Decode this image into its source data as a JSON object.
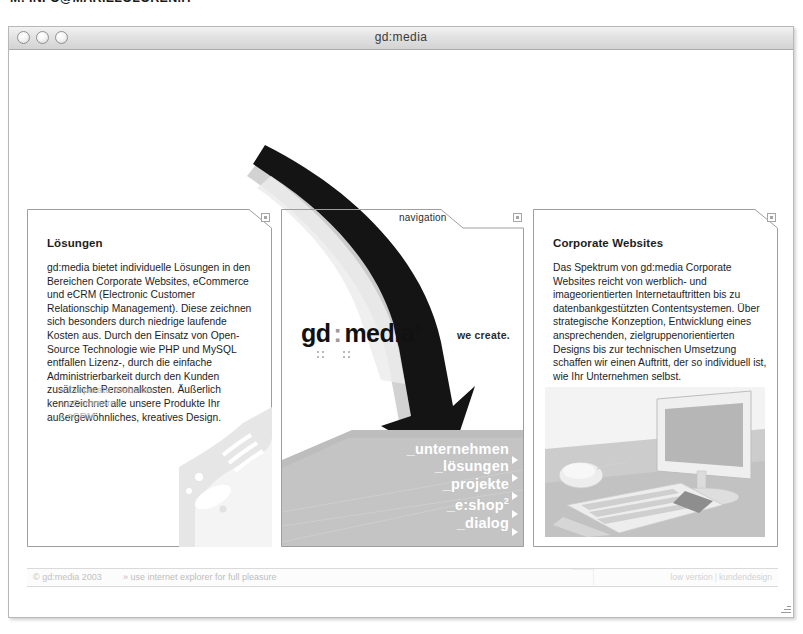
{
  "page_header": {
    "cut_label": "M:",
    "cut_address": "INFO@MARIELOLOREN.IT"
  },
  "window": {
    "title": "gd:media",
    "controls": [
      "close-button",
      "minimize-button",
      "zoom-button"
    ]
  },
  "site": {
    "logo_left": "gd",
    "logo_colon": ":",
    "logo_right": "media",
    "logo_registered": "®",
    "tagline": "we create."
  },
  "panels": {
    "left": {
      "title": "Lösungen",
      "body": "gd:media bietet individuelle Lösungen in den Bereichen Corporate Websites, eCommerce und eCRM (Electronic Customer Relationschip Management). Diese zeichnen sich besonders durch niedrige laufende Kosten aus. Durch den Einsatz von Open-Source Technologie wie PHP und MySQL entfallen Lizenz-, durch die einfache Administrierbarkeit durch den Kunden zusätzliche Personalkosten. Äußerlich kennzeichnet alle unsere Produkte Ihr außergewöhnliches, kreatives Design.",
      "links": [
        "» Corporate Websites",
        "» eCommerce",
        "» eCRM"
      ],
      "corner_icon": "close-box-icon"
    },
    "center": {
      "tab_label": "navigation",
      "corner_icon": "close-box-icon",
      "nav_items": [
        {
          "label": "_unternehmen",
          "sup": ""
        },
        {
          "label": "_lösungen",
          "sup": ""
        },
        {
          "label": "_projekte",
          "sup": ""
        },
        {
          "label": "_e:shop",
          "sup": "2"
        },
        {
          "label": "_dialog",
          "sup": ""
        }
      ]
    },
    "right": {
      "title": "Corporate Websites",
      "body": "Das Spektrum von gd:media Corporate Websites reicht von werblich- und imageorientierten Internetauftritten bis zu datenbankgestützten Contentsystemen. Über strategische Konzeption, Entwicklung eines ansprechenden, zielgruppenorientierten Designs bis zur technischen Umsetzung schaffen wir einen Auftritt, der so individuell ist, wie Ihr Unternehmen selbst.",
      "corner_icon": "close-box-icon",
      "image_alt": "desktop-computer-photo"
    }
  },
  "footer": {
    "copyright": "© gd:media 2003",
    "hint": "» use internet explorer for full pleasure",
    "version_label": "low version",
    "separator": "|",
    "design_label": "kundendesign"
  },
  "colors": {
    "swoosh_dark": "#111111",
    "swoosh_light": "#cfcfcf",
    "floor_gray": "#bdbdbd",
    "panel_border": "#9e9e9e",
    "muted_text": "#b4b4b4"
  }
}
